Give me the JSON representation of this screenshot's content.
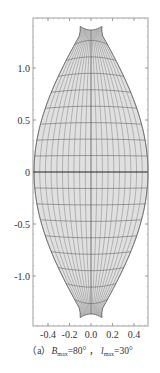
{
  "chart_data": {
    "type": "map-projection-graticule",
    "title": "",
    "caption": {
      "prefix": "（a）",
      "b_symbol": "B",
      "b_sub": "max",
      "b_value": "=80°",
      "separator": " ，",
      "l_symbol": "l",
      "l_sub": "max",
      "l_value": "=30°"
    },
    "params": {
      "B_max_deg": 80,
      "l_max_deg": 30
    },
    "xlim": [
      -0.55,
      0.55
    ],
    "ylim": [
      -1.45,
      1.45
    ],
    "x_ticks": [
      -0.4,
      -0.2,
      0.0,
      0.2,
      0.4
    ],
    "x_tick_labels": [
      "-0.4",
      "-0.2",
      "0.0",
      "0.2",
      "0.4"
    ],
    "y_ticks": [
      -1.0,
      -0.5,
      0,
      0.5,
      1.0
    ],
    "y_tick_labels": [
      "-1.0",
      "-0.5",
      "0",
      "0.5",
      "1.0"
    ],
    "outline": {
      "half_width_at_equator": 0.53,
      "half_width_at_pole": 0.1,
      "pole_y": 1.4
    },
    "graticule": {
      "meridian_count_each_side": 10,
      "parallel_step_deg": 10
    },
    "grid": false,
    "legend": "none",
    "fill_color": "#e0e0e0",
    "line_color": "#555555",
    "axis_color": "#222222"
  }
}
